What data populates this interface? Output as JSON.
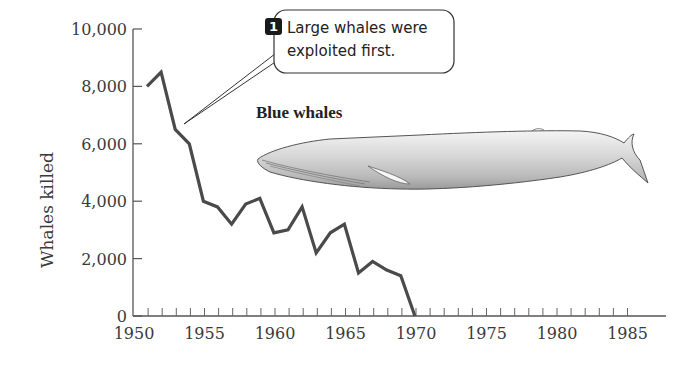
{
  "chart_data": {
    "type": "line",
    "title": "",
    "xlabel": "",
    "ylabel": "Whales killed",
    "xlim": [
      1950,
      1987
    ],
    "ylim": [
      0,
      10000
    ],
    "grid": false,
    "x_ticks": [
      1950,
      1955,
      1960,
      1965,
      1970,
      1975,
      1980,
      1985
    ],
    "x_tick_labels": [
      "1950",
      "1955",
      "1960",
      "1965",
      "1970",
      "1975",
      "1980",
      "1985"
    ],
    "y_ticks": [
      0,
      2000,
      4000,
      6000,
      8000,
      10000
    ],
    "y_tick_labels": [
      "0",
      "2,000",
      "4,000",
      "6,000",
      "8,000",
      "10,000"
    ],
    "series": [
      {
        "name": "Blue whales",
        "color": "#4a4a4a",
        "x": [
          1950,
          1951,
          1952,
          1953,
          1954,
          1955,
          1956,
          1957,
          1958,
          1959,
          1960,
          1961,
          1962,
          1963,
          1964,
          1965,
          1966,
          1967,
          1968,
          1969
        ],
        "values": [
          8000,
          8500,
          6500,
          6000,
          4000,
          3800,
          3200,
          3900,
          4100,
          2900,
          3000,
          3800,
          2200,
          2900,
          3200,
          1500,
          1900,
          1600,
          1400,
          0
        ]
      }
    ],
    "annotations": [
      {
        "number": "1",
        "text_line1": "Large whales were",
        "text_line2": "exploited first.",
        "points_to_year": 1953
      },
      {
        "text": "Blue whales",
        "type": "series-label-with-illustration"
      }
    ],
    "legend": "none"
  },
  "labels": {
    "ylabel": "Whales killed",
    "series_title": "Blue whales",
    "callout_number": "1",
    "callout_line1": "Large whales were",
    "callout_line2": "exploited first."
  },
  "illustration": {
    "subject": "blue-whale-icon"
  }
}
